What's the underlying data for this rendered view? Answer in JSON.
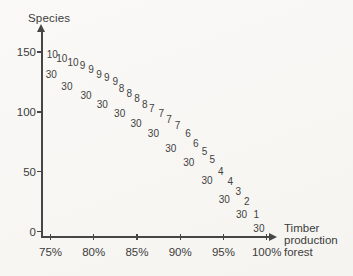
{
  "meta": {
    "background": "#f7f6f2",
    "ink": "#464646"
  },
  "chart_data": {
    "type": "scatter",
    "marker_style": "numeric-text-labels",
    "title": "",
    "ylabel": "Species",
    "xlabel": "Timber production forest",
    "xlabel_lines": [
      "Timber",
      "production",
      "forest"
    ],
    "x_unit": "percent",
    "xlim": [
      74,
      101.5
    ],
    "ylim": [
      0,
      168
    ],
    "grid": false,
    "legend": "none",
    "y_ticks": [
      {
        "value": 150,
        "label": "150"
      },
      {
        "value": 100,
        "label": "100"
      },
      {
        "value": 50,
        "label": "50"
      },
      {
        "value": 0,
        "label": "0"
      }
    ],
    "x_ticks": [
      {
        "value": 75,
        "label": "75%"
      },
      {
        "value": 80,
        "label": "80%"
      },
      {
        "value": 85,
        "label": "85%"
      },
      {
        "value": 90,
        "label": "90%"
      },
      {
        "value": 95,
        "label": "95%"
      },
      {
        "value": 100,
        "label": "100%"
      }
    ],
    "series": [
      {
        "name": "numbered-points",
        "points": [
          {
            "label": "10",
            "x": 75.2,
            "y": 148
          },
          {
            "label": "10",
            "x": 76.3,
            "y": 145
          },
          {
            "label": "10",
            "x": 77.6,
            "y": 142
          },
          {
            "label": "9",
            "x": 78.7,
            "y": 139
          },
          {
            "label": "9",
            "x": 79.7,
            "y": 136
          },
          {
            "label": "9",
            "x": 80.6,
            "y": 132
          },
          {
            "label": "9",
            "x": 81.5,
            "y": 129
          },
          {
            "label": "9",
            "x": 82.5,
            "y": 126
          },
          {
            "label": "8",
            "x": 83.2,
            "y": 120
          },
          {
            "label": "8",
            "x": 84.1,
            "y": 116
          },
          {
            "label": "8",
            "x": 85.0,
            "y": 112
          },
          {
            "label": "8",
            "x": 85.9,
            "y": 107
          },
          {
            "label": "7",
            "x": 86.7,
            "y": 103
          },
          {
            "label": "7",
            "x": 87.8,
            "y": 99
          },
          {
            "label": "7",
            "x": 88.7,
            "y": 94
          },
          {
            "label": "7",
            "x": 89.7,
            "y": 89
          },
          {
            "label": "6",
            "x": 90.9,
            "y": 82
          },
          {
            "label": "6",
            "x": 91.8,
            "y": 74
          },
          {
            "label": "5",
            "x": 92.8,
            "y": 67
          },
          {
            "label": "5",
            "x": 93.7,
            "y": 61
          },
          {
            "label": "4",
            "x": 94.7,
            "y": 51
          },
          {
            "label": "4",
            "x": 95.8,
            "y": 42
          },
          {
            "label": "3",
            "x": 96.7,
            "y": 34
          },
          {
            "label": "2",
            "x": 97.7,
            "y": 26
          },
          {
            "label": "1",
            "x": 98.8,
            "y": 15
          }
        ]
      },
      {
        "name": "thirty-points",
        "points": [
          {
            "label": "30",
            "x": 75.1,
            "y": 132
          },
          {
            "label": "30",
            "x": 76.9,
            "y": 122
          },
          {
            "label": "30",
            "x": 79.1,
            "y": 114
          },
          {
            "label": "30",
            "x": 81.0,
            "y": 107
          },
          {
            "label": "30",
            "x": 83.0,
            "y": 99
          },
          {
            "label": "30",
            "x": 84.9,
            "y": 91
          },
          {
            "label": "30",
            "x": 86.9,
            "y": 82
          },
          {
            "label": "30",
            "x": 88.9,
            "y": 70
          },
          {
            "label": "30",
            "x": 91.0,
            "y": 58
          },
          {
            "label": "30",
            "x": 93.1,
            "y": 43
          },
          {
            "label": "30",
            "x": 95.1,
            "y": 27
          },
          {
            "label": "30",
            "x": 97.1,
            "y": 15
          },
          {
            "label": "30",
            "x": 99.1,
            "y": 3
          }
        ]
      }
    ]
  }
}
